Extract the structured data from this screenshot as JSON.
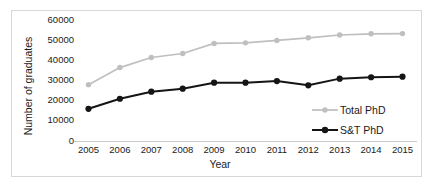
{
  "chart_data": {
    "type": "line",
    "title": "",
    "xlabel": "Year",
    "ylabel": "Number of graduates",
    "categories": [
      "2005",
      "2006",
      "2007",
      "2008",
      "2009",
      "2010",
      "2011",
      "2012",
      "2013",
      "2014",
      "2015"
    ],
    "x": [
      2005,
      2006,
      2007,
      2008,
      2009,
      2010,
      2011,
      2012,
      2013,
      2014,
      2015
    ],
    "xlim": [
      2005,
      2015
    ],
    "ylim": [
      0,
      60000
    ],
    "yticks": [
      0,
      10000,
      20000,
      30000,
      40000,
      50000,
      60000
    ],
    "ytick_labels": [
      "0",
      "10000",
      "20000",
      "30000",
      "40000",
      "50000",
      "60000"
    ],
    "grid": false,
    "legend_position": "center-right-inside",
    "series": [
      {
        "name": "Total PhD",
        "color": "#bfbfbf",
        "marker": "circle",
        "values": [
          28000,
          36500,
          41500,
          43500,
          48500,
          48800,
          50000,
          51300,
          52700,
          53300,
          53400
        ]
      },
      {
        "name": "S&T PhD",
        "color": "#151515",
        "marker": "circle",
        "values": [
          16000,
          21000,
          24500,
          26000,
          29000,
          29000,
          29800,
          27700,
          31000,
          31700,
          32000
        ]
      }
    ]
  },
  "legend": {
    "entries": [
      {
        "label": "Total PhD"
      },
      {
        "label": "S&T PhD"
      }
    ]
  },
  "colors": {
    "total_phd": "#bfbfbf",
    "st_phd": "#151515",
    "axis": "#bfbfbf",
    "frame": "#d8d8d8",
    "text": "#1a1a1a",
    "background": "#ffffff"
  }
}
